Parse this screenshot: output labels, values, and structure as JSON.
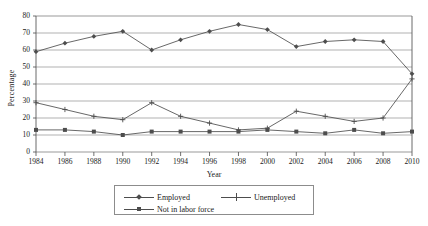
{
  "chart_data": {
    "type": "line",
    "title": "",
    "xlabel": "Year",
    "ylabel": "Percentage",
    "categories": [
      1984,
      1986,
      1988,
      1990,
      1992,
      1994,
      1996,
      1998,
      2000,
      2002,
      2004,
      2006,
      2008,
      2010
    ],
    "xlim": [
      1984,
      2010
    ],
    "ylim": [
      0,
      80
    ],
    "ytick_labels": [
      "0",
      "10",
      "20",
      "30",
      "40",
      "50",
      "60",
      "70",
      "80"
    ],
    "ytick_values": [
      0,
      10,
      20,
      30,
      40,
      50,
      60,
      70,
      80
    ],
    "xtick_labels": [
      "1984",
      "1986",
      "1988",
      "1990",
      "1992",
      "1994",
      "1996",
      "1998",
      "2000",
      "2002",
      "2004",
      "2006",
      "2008",
      "2010"
    ],
    "grid": "horizontal",
    "legend_position": "bottom",
    "series": [
      {
        "name": "Employed",
        "marker": "diamond",
        "color": "#4d4d4d",
        "values": [
          59,
          64,
          68,
          71,
          60,
          66,
          71,
          75,
          72,
          62,
          65,
          66,
          65,
          46
        ]
      },
      {
        "name": "Unemployed",
        "marker": "plus",
        "color": "#4d4d4d",
        "values": [
          29,
          25,
          21,
          19,
          29,
          21,
          17,
          13,
          14,
          24,
          21,
          18,
          20,
          43
        ]
      },
      {
        "name": "Not in labor force",
        "marker": "square",
        "color": "#4d4d4d",
        "values": [
          13,
          13,
          12,
          10,
          12,
          12,
          12,
          12,
          13,
          12,
          11,
          13,
          11,
          12
        ]
      }
    ]
  },
  "legend": {
    "items": [
      {
        "label": "Employed",
        "marker": "diamond"
      },
      {
        "label": "Unemployed",
        "marker": "plus"
      },
      {
        "label": "Not in labor force",
        "marker": "square"
      }
    ]
  }
}
